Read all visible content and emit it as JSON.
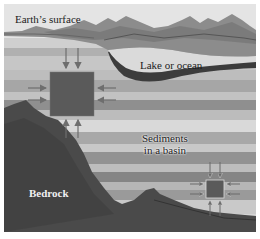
{
  "diagram": {
    "type": "geological-cross-section",
    "labels": {
      "surface": "Earth’s surface",
      "lake": "Lake or ocean",
      "sediments_line1": "Sediments",
      "sediments_line2": "in a basin",
      "bedrock": "Bedrock"
    },
    "elements": {
      "large_block": {
        "description": "sediment element under pressure (shallow)",
        "arrows": [
          "down",
          "down",
          "right",
          "right",
          "left",
          "left",
          "up",
          "up"
        ]
      },
      "small_block": {
        "description": "sediment element under pressure (deep, compacted)",
        "arrows": [
          "down",
          "down",
          "right",
          "right",
          "left",
          "left",
          "up",
          "up"
        ]
      }
    },
    "colors": {
      "sky": "#e2e2e2",
      "mountain": "#8a8a8a",
      "lake": "#d8d8d8",
      "sediment_light": "#d6d6d6",
      "sediment_mid": "#b4b4b4",
      "sediment_dark": "#8e8e8e",
      "bedrock": "#4a4a4a",
      "block": "#5a5a5a",
      "arrow": "#6e6e6e"
    }
  }
}
